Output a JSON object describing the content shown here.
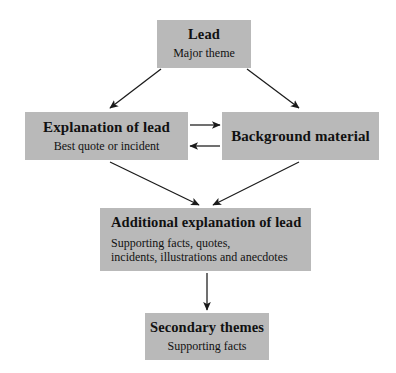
{
  "diagram": {
    "background_color": "#ffffff",
    "box_fill_color": "#b9b9b9",
    "line_color": "#1a1a1a",
    "nodes": {
      "lead": {
        "title": "Lead",
        "subtitle": "Major theme"
      },
      "explanation": {
        "title": "Explanation of lead",
        "subtitle": "Best quote or incident"
      },
      "background": {
        "title": "Background material",
        "subtitle": ""
      },
      "additional": {
        "title": "Additional explanation of lead",
        "subtitle_line1": "Supporting facts, quotes,",
        "subtitle_line2": "incidents, illustrations and anecdotes"
      },
      "secondary": {
        "title": "Secondary themes",
        "subtitle": "Supporting facts"
      }
    },
    "connectors": [
      {
        "name": "lead-to-explanation",
        "from": "lead",
        "to": "explanation",
        "direction": "one-way"
      },
      {
        "name": "lead-to-background",
        "from": "lead",
        "to": "background",
        "direction": "one-way"
      },
      {
        "name": "explanation-to-background",
        "from": "explanation",
        "to": "background",
        "direction": "one-way"
      },
      {
        "name": "background-to-explanation",
        "from": "background",
        "to": "explanation",
        "direction": "one-way"
      },
      {
        "name": "explanation-to-additional",
        "from": "explanation",
        "to": "additional",
        "direction": "one-way"
      },
      {
        "name": "background-to-additional",
        "from": "background",
        "to": "additional",
        "direction": "one-way"
      },
      {
        "name": "additional-to-secondary",
        "from": "additional",
        "to": "secondary",
        "direction": "one-way"
      }
    ]
  }
}
